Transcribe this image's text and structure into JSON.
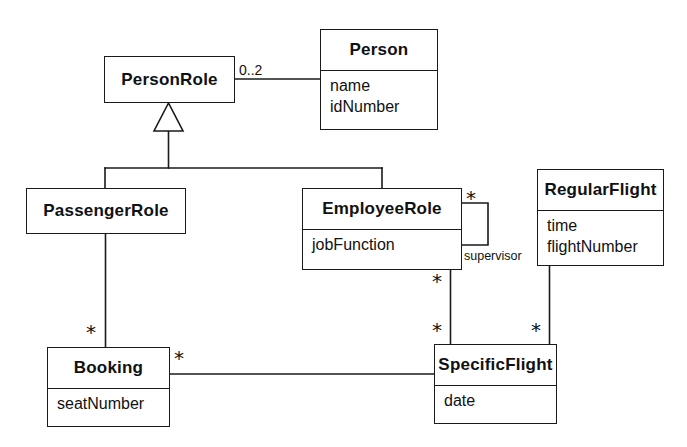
{
  "diagram": {
    "type": "uml-class-diagram",
    "background_color": "#ffffff",
    "line_color": "#1a1a1a",
    "text_color": "#111111"
  },
  "classes": [
    {
      "id": "person",
      "name": "Person",
      "attributes": [
        "name",
        "idNumber"
      ],
      "box": {
        "x": 320,
        "y": 29,
        "w": 118,
        "h": 101,
        "divider_y": 40
      }
    },
    {
      "id": "person_role",
      "name": "PersonRole",
      "attributes": [],
      "box": {
        "x": 104,
        "y": 56,
        "w": 131,
        "h": 47,
        "divider_y": 47
      }
    },
    {
      "id": "passenger_role",
      "name": "PassengerRole",
      "attributes": [],
      "box": {
        "x": 26,
        "y": 188,
        "w": 160,
        "h": 46,
        "divider_y": 46
      }
    },
    {
      "id": "employee_role",
      "name": "EmployeeRole",
      "attributes": [
        "jobFunction"
      ],
      "box": {
        "x": 302,
        "y": 188,
        "w": 160,
        "h": 82,
        "divider_y": 40
      }
    },
    {
      "id": "regular_flight",
      "name": "RegularFlight",
      "attributes": [
        "time",
        "flightNumber"
      ],
      "box": {
        "x": 537,
        "y": 169,
        "w": 127,
        "h": 97,
        "divider_y": 40
      }
    },
    {
      "id": "booking",
      "name": "Booking",
      "attributes": [
        "seatNumber"
      ],
      "box": {
        "x": 47,
        "y": 347,
        "w": 123,
        "h": 80,
        "divider_y": 40
      }
    },
    {
      "id": "specific_flight",
      "name": "SpecificFlight",
      "attributes": [
        "date"
      ],
      "box": {
        "x": 434,
        "y": 344,
        "w": 123,
        "h": 80,
        "divider_y": 40
      }
    }
  ],
  "relationships": [
    {
      "id": "personrole-person",
      "kind": "association",
      "from": "person_role",
      "to": "person",
      "source_multiplicity": "0..2",
      "target_multiplicity": "",
      "role": ""
    },
    {
      "id": "personrole-generalization",
      "kind": "generalization",
      "parent": "person_role",
      "children": [
        "passenger_role",
        "employee_role"
      ]
    },
    {
      "id": "employeerole-supervisor",
      "kind": "self-association",
      "from": "employee_role",
      "to": "employee_role",
      "source_multiplicity": "*",
      "target_multiplicity": "*",
      "role": "supervisor"
    },
    {
      "id": "passengerrole-booking",
      "kind": "association",
      "from": "passenger_role",
      "to": "booking",
      "source_multiplicity": "",
      "target_multiplicity": "*",
      "role": ""
    },
    {
      "id": "booking-specificflight",
      "kind": "association",
      "from": "booking",
      "to": "specific_flight",
      "source_multiplicity": "*",
      "target_multiplicity": "",
      "role": ""
    },
    {
      "id": "employeerole-specificflight",
      "kind": "association",
      "from": "employee_role",
      "to": "specific_flight",
      "source_multiplicity": "*",
      "target_multiplicity": "*",
      "role": ""
    },
    {
      "id": "regularflight-specificflight",
      "kind": "association",
      "from": "regular_flight",
      "to": "specific_flight",
      "source_multiplicity": "",
      "target_multiplicity": "*",
      "role": ""
    }
  ],
  "labels": {
    "person_role_to_person_mult": "0..2",
    "employee_supervisor_mult_top": "*",
    "employee_supervisor_role": "supervisor",
    "employee_to_flight_mult_upper": "*",
    "employee_to_flight_mult_lower": "*",
    "passenger_to_booking_mult": "*",
    "booking_to_flight_mult": "*",
    "regular_to_specific_mult": "*"
  }
}
